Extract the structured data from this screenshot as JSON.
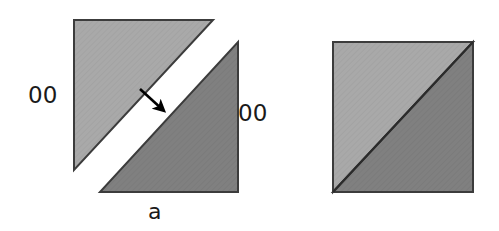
{
  "figure": {
    "width": 499,
    "height": 231,
    "background_color": "#ffffff",
    "panels": [
      {
        "id": "a",
        "caption": "a",
        "description": "Square split along its anti-diagonal into two triangular halves that have been pulled apart, with an arrow indicating the separation direction",
        "labels": {
          "left": "00",
          "right": "00"
        },
        "shapes": [
          {
            "name": "upper-left-triangle",
            "fill": "#a9a9a9",
            "stroke": "#3c3c3c",
            "points": "74,20 213,20 74,170"
          },
          {
            "name": "lower-right-triangle",
            "fill": "#808080",
            "stroke": "#3c3c3c",
            "points": "238,42 238,192 100,192"
          }
        ],
        "arrow": {
          "name": "separation-arrow",
          "color": "#000000",
          "from_x": 140,
          "from_y": 89,
          "to_x": 166,
          "to_y": 113
        }
      },
      {
        "id": "b",
        "caption": "b",
        "description": "Intact square split by a diagonal into a light upper-left half and a dark lower-right half",
        "shapes": [
          {
            "name": "upper-left-half",
            "fill": "#a9a9a9",
            "stroke": "#3c3c3c",
            "points": "333,42 473,42 333,192"
          },
          {
            "name": "lower-right-half",
            "fill": "#808080",
            "stroke": "#3c3c3c",
            "points": "473,42 473,192 333,192"
          }
        ]
      }
    ],
    "colors": {
      "light_gray": "#a9a9a9",
      "dark_gray": "#808080",
      "outline": "#3c3c3c",
      "text": "#1a1a1a",
      "arrow": "#000000"
    }
  }
}
